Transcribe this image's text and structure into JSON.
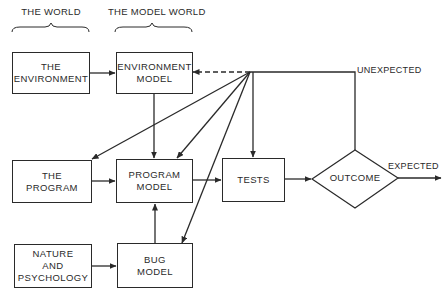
{
  "headers": {
    "the_world": "THE WORLD",
    "the_model_world": "THE MODEL WORLD"
  },
  "nodes": {
    "the_environment": "THE\nENVIRONMENT",
    "environment_model": "ENVIRONMENT\nMODEL",
    "the_program": "THE\nPROGRAM",
    "program_model": "PROGRAM\nMODEL",
    "tests": "TESTS",
    "outcome": "OUTCOME",
    "nature_and_psychology": "NATURE\nAND\nPSYCHOLOGY",
    "bug_model": "BUG\nMODEL"
  },
  "edge_labels": {
    "unexpected": "UNEXPECTED",
    "expected": "EXPECTED"
  },
  "colors": {
    "line": "#2a2a2a",
    "background": "#ffffff"
  }
}
